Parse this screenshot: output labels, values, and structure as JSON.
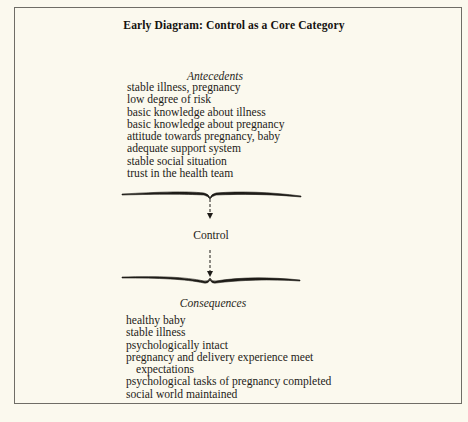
{
  "diagram": {
    "title": "Early Diagram: Control as a Core Category",
    "antecedents": {
      "heading": "Antecedents",
      "items": [
        "stable illness, pregnancy",
        "low degree of risk",
        "basic knowledge about illness",
        "basic knowledge about pregnancy",
        "attitude towards pregnancy, baby",
        "adequate support system",
        "stable social situation",
        "trust in the health team"
      ]
    },
    "core_category": "Control",
    "consequences": {
      "heading": "Consequences",
      "items": [
        {
          "text": "healthy baby"
        },
        {
          "text": "stable illness"
        },
        {
          "text": "psychologically intact"
        },
        {
          "text": "pregnancy and delivery experience meet",
          "continuation": "expectations"
        },
        {
          "text": "psychological tasks of pregnancy completed"
        },
        {
          "text": "social world maintained"
        }
      ]
    },
    "flow": [
      {
        "from": "Antecedents",
        "to": "Control",
        "style": "dashed-arrow",
        "connector": "brace-down"
      },
      {
        "from": "Control",
        "to": "Consequences",
        "style": "dashed-arrow",
        "connector": "brace-up"
      }
    ],
    "colors": {
      "background": "#fbf9ee",
      "frame": "#6f6d66",
      "text": "#1e1c18"
    }
  }
}
